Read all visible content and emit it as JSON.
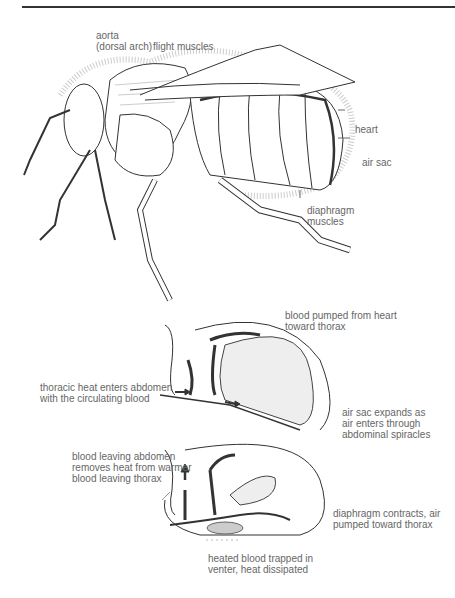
{
  "figure": {
    "bee_labels": {
      "aorta": "aorta",
      "aorta_sub": "(dorsal arch)",
      "flight_muscles": "flight muscles",
      "heart": "heart",
      "air_sac": "air sac",
      "diaphragm_1": "diaphragm",
      "diaphragm_2": "muscles"
    },
    "panel1_labels": {
      "pumped_1": "blood pumped from heart",
      "pumped_2": "toward thorax",
      "thoracic_1": "thoracic heat enters abdomen",
      "thoracic_2": "with the circulating blood",
      "airsac_1": "air sac expands as",
      "airsac_2": "air enters through",
      "airsac_3": "abdominal spiracles"
    },
    "panel2_labels": {
      "leaving_1": "blood leaving abdomen",
      "leaving_2": "removes heat from warmer",
      "leaving_3": "blood leaving thorax",
      "diaphragm_1": "diaphragm contracts, air",
      "diaphragm_2": "pumped toward thorax",
      "trapped_1": "heated blood trapped in",
      "trapped_2": "venter, heat dissipated"
    },
    "colors": {
      "line": "#333333",
      "text": "#666666",
      "stipple": "#bbbbbb"
    }
  }
}
